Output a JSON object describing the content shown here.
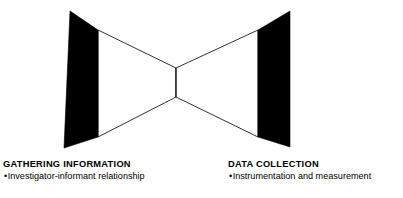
{
  "figure": {
    "name": "bowtie-funnel-diagram",
    "colors": {
      "fill_solid": "#000000",
      "fill_open": "#ffffff",
      "stroke": "#1a1a1a",
      "background": "#ffffff"
    },
    "shapes": [
      {
        "id": "left-funnel",
        "label": "left-funnel",
        "solid_bar": {
          "points": "70,11 98,30 98,137 64,148"
        },
        "open_taper": {
          "points": "98,30 176,68 176,97 98,137"
        }
      },
      {
        "id": "right-funnel",
        "label": "right-funnel",
        "solid_bar": {
          "points": "258,30 290,11 290,147 258,137"
        },
        "open_taper": {
          "points": "176,68 258,30 258,137 176,97"
        }
      },
      {
        "id": "center-waist",
        "label": "center-waist",
        "line": {
          "x1": 176,
          "y1": 68,
          "x2": 176,
          "y2": 97
        }
      }
    ]
  },
  "captions": {
    "left": {
      "heading": "GATHERING INFORMATION",
      "bullet_mark": "•",
      "bullet": "Investigator-informant relationship"
    },
    "right": {
      "heading": "DATA COLLECTION",
      "bullet_mark": "•",
      "bullet": "Instrumentation and measurement"
    }
  }
}
